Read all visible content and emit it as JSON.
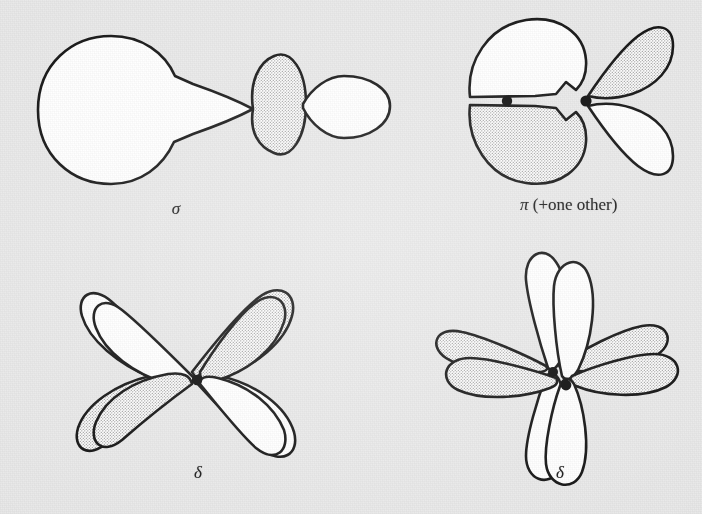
{
  "figure": {
    "kind": "molecular-orbital-overlap-diagram",
    "background_color": "#e9e9e9",
    "ink_color": "#141414",
    "lobe_fill_plain": "#ffffff",
    "lobe_fill_shaded": "#e3e3e3",
    "nucleus_color": "#0d0d0d"
  },
  "panels": [
    {
      "id": "sigma",
      "label": "σ",
      "label_plain": "sigma",
      "position": "top-left",
      "bond_type": "sigma",
      "overlap": "head-on, end-to-end lobe overlap",
      "lobe_count": 4,
      "nuclei_visible": 0,
      "lobes": [
        {
          "name": "large-left-lobe",
          "shade": "plain",
          "direction": "left"
        },
        {
          "name": "left-inner-lobe",
          "shade": "plain",
          "direction": "right"
        },
        {
          "name": "center-oval-lobe",
          "shade": "shaded",
          "direction": "center"
        },
        {
          "name": "right-lobe",
          "shade": "plain",
          "direction": "right"
        }
      ]
    },
    {
      "id": "pi",
      "label": "π (+one other)",
      "label_greek": "π",
      "label_suffix": " (+one other)",
      "label_plain": "pi (+one other)",
      "position": "top-right",
      "bond_type": "pi",
      "overlap": "side-on lateral lobe overlap",
      "lobe_count": 4,
      "nuclei_visible": 2,
      "lobes": [
        {
          "name": "upper-left-lobe",
          "shade": "plain",
          "direction": "upper-left"
        },
        {
          "name": "lower-left-lobe",
          "shade": "shaded",
          "direction": "lower-left"
        },
        {
          "name": "upper-right-lobe",
          "shade": "shaded",
          "direction": "upper-right"
        },
        {
          "name": "lower-right-lobe",
          "shade": "plain",
          "direction": "lower-right"
        }
      ]
    },
    {
      "id": "delta-left",
      "label": "δ",
      "label_plain": "delta",
      "position": "bottom-left",
      "bond_type": "delta",
      "overlap": "face-to-face overlap of two four-lobed d orbitals",
      "lobe_count": 8,
      "nuclei_visible": 1,
      "lobes": [
        {
          "name": "front-upper-left-lobe",
          "shade": "plain",
          "direction": "upper-left"
        },
        {
          "name": "front-upper-right-lobe",
          "shade": "shaded",
          "direction": "upper-right"
        },
        {
          "name": "front-lower-left-lobe",
          "shade": "shaded",
          "direction": "lower-left"
        },
        {
          "name": "front-lower-right-lobe",
          "shade": "plain",
          "direction": "lower-right"
        },
        {
          "name": "back-upper-left-lobe",
          "shade": "plain",
          "direction": "upper-left"
        },
        {
          "name": "back-upper-right-lobe",
          "shade": "shaded",
          "direction": "upper-right"
        },
        {
          "name": "back-lower-left-lobe",
          "shade": "shaded",
          "direction": "lower-left"
        },
        {
          "name": "back-lower-right-lobe",
          "shade": "plain",
          "direction": "lower-right"
        }
      ]
    },
    {
      "id": "delta-right",
      "label": "δ",
      "label_plain": "delta",
      "position": "bottom-right",
      "bond_type": "delta",
      "overlap": "face-to-face overlap of two four-lobed d orbitals, offset view",
      "lobe_count": 8,
      "nuclei_visible": 2,
      "lobes": [
        {
          "name": "front-top-lobe",
          "shade": "plain",
          "direction": "up"
        },
        {
          "name": "front-bottom-lobe",
          "shade": "plain",
          "direction": "down"
        },
        {
          "name": "front-left-lobe",
          "shade": "shaded",
          "direction": "left"
        },
        {
          "name": "front-right-lobe",
          "shade": "shaded",
          "direction": "right"
        },
        {
          "name": "back-top-lobe",
          "shade": "plain",
          "direction": "up"
        },
        {
          "name": "back-bottom-lobe",
          "shade": "plain",
          "direction": "down"
        },
        {
          "name": "back-left-lobe",
          "shade": "shaded",
          "direction": "left"
        },
        {
          "name": "back-right-lobe",
          "shade": "shaded",
          "direction": "right"
        }
      ]
    }
  ]
}
